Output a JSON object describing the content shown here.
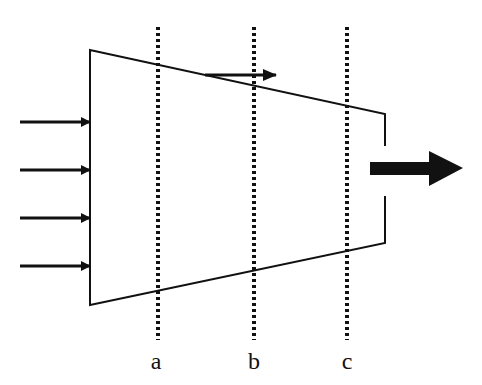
{
  "diagram": {
    "type": "flow-through-nozzle",
    "sections": [
      {
        "id": "a",
        "label": "a",
        "x": 158
      },
      {
        "id": "b",
        "label": "b",
        "x": 254
      },
      {
        "id": "c",
        "label": "c",
        "x": 347
      }
    ],
    "inflow_arrow_count": 4,
    "colors": {
      "stroke": "#111111",
      "background": "#ffffff"
    }
  }
}
